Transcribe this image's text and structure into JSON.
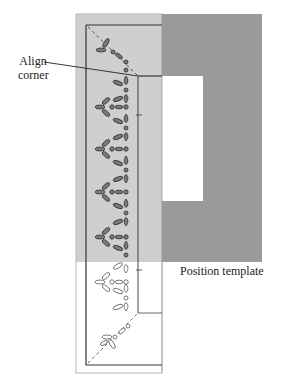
{
  "labels": {
    "align_corner_line1": "Align",
    "align_corner_line2": "corner",
    "position_template": "Position template"
  },
  "colors": {
    "fabric_light_gray": "#cfcfcf",
    "template_dark_gray": "#9a9a9a",
    "outline": "#333333",
    "motif_fill": "#7a7a7a",
    "background": "#ffffff"
  },
  "motifs": {
    "rows_on_gray": 5,
    "rows_below_template": 1,
    "diagonal_corner_top": "dashed diagonal with leaf motifs",
    "diagonal_corner_bottom": "dashed diagonal with leaf motifs"
  }
}
